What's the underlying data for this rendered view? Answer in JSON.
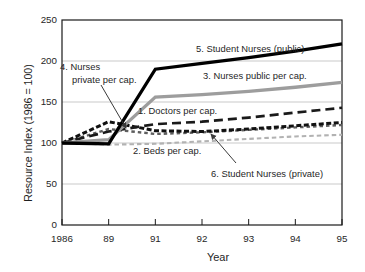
{
  "chart_data": {
    "type": "line",
    "title": "",
    "xlabel": "Year",
    "ylabel": "Resource Index (1986 = 100)",
    "categories": [
      "1986",
      "89",
      "91",
      "92",
      "93",
      "94",
      "95"
    ],
    "ylim": [
      0,
      250
    ],
    "yticks": [
      0,
      50,
      100,
      150,
      200,
      250
    ],
    "grid": "horizontal",
    "legend_position": "inline-labels-with-leader-lines",
    "series": [
      {
        "id": "1",
        "label": "1. Doctors per cap.",
        "color": "#1a1a1a",
        "dash": "9 5",
        "width": 2.7,
        "values": [
          100,
          114,
          123,
          126,
          131,
          137,
          143
        ]
      },
      {
        "id": "2",
        "label": "2. Beds per cap.",
        "color": "#b2b2b2",
        "dash": "4.5 3",
        "width": 2.1,
        "values": [
          100,
          98,
          99,
          102,
          105,
          108,
          110
        ]
      },
      {
        "id": "3",
        "label": "3. Nurses public per cap.",
        "color": "#9d9d9d",
        "dash": "",
        "width": 3.3,
        "values": [
          100,
          104,
          156,
          159,
          163,
          168,
          174
        ]
      },
      {
        "id": "4",
        "label": "4. Nurses private per cap.",
        "label_line1": "4. Nurses",
        "label_line2": "private per cap.",
        "color": "#111111",
        "dash": "5 2.5",
        "width": 3,
        "values": [
          100,
          126,
          115,
          114,
          117,
          121,
          125
        ]
      },
      {
        "id": "5",
        "label": "5. Student Nurses (public)",
        "color": "#000000",
        "dash": "",
        "width": 3.3,
        "values": [
          100,
          99,
          190,
          197,
          204,
          212,
          221
        ]
      },
      {
        "id": "6",
        "label": "6. Student Nurses (private)",
        "color": "#5e5e5e",
        "dash": "3.5 3",
        "width": 2.4,
        "values": [
          100,
          117,
          111,
          113,
          116,
          119,
          122
        ]
      }
    ]
  }
}
